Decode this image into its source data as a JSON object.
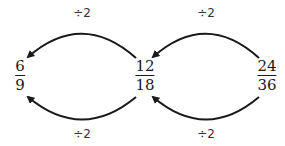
{
  "fractions": [
    {
      "numerator": "6",
      "denominator": "9"
    },
    {
      "numerator": "12",
      "denominator": "18"
    },
    {
      "numerator": "24",
      "denominator": "36"
    }
  ],
  "operations": {
    "top_left": "÷2",
    "top_right": "÷2",
    "bottom_left": "÷2",
    "bottom_right": "÷2"
  },
  "colors": {
    "ink": "#1a1a1a",
    "background": "#ffffff"
  }
}
